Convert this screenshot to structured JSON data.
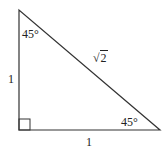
{
  "diagram": {
    "type": "right-triangle",
    "vertices": {
      "top": [
        19,
        10
      ],
      "bottom_left": [
        19,
        130
      ],
      "bottom_right": [
        160,
        130
      ]
    },
    "right_angle_marker": {
      "x": 19,
      "y": 119,
      "size": 11
    },
    "stroke_color": "#333333",
    "labels": {
      "angle_top": "45°",
      "angle_bottom_right": "45°",
      "leg_vertical": "1",
      "leg_horizontal": "1",
      "hypotenuse_radical": "√",
      "hypotenuse_radicand": "2"
    }
  }
}
